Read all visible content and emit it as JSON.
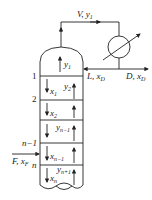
{
  "diagram": {
    "top_stream": {
      "label": "V, y",
      "sub": "1"
    },
    "reflux": {
      "label": "L, x",
      "sub": "D"
    },
    "distillate": {
      "label": "D, x",
      "sub": "D"
    },
    "feed": {
      "label": "F, x",
      "sub": "F"
    },
    "tray_numbers": [
      "1",
      "2",
      "n−1",
      "n"
    ],
    "vapor_labels": [
      {
        "label": "y",
        "sub": "1"
      },
      {
        "label": "y",
        "sub": "2"
      },
      {
        "label": "y",
        "sub": "n−1"
      },
      {
        "label": "y",
        "sub": "n+1"
      }
    ],
    "liquid_labels": [
      {
        "label": "x",
        "sub": "1"
      },
      {
        "label": "x",
        "sub": "2"
      },
      {
        "label": "x",
        "sub": "n−1"
      },
      {
        "label": "x",
        "sub": "n"
      }
    ],
    "colors": {
      "line": "#222222",
      "background": "#ffffff"
    }
  }
}
